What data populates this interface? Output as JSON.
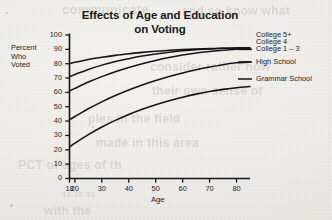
{
  "figure": {
    "title_line_1": "Effects of Age and Education",
    "title_line_2": "on Voting",
    "y_caption_line_1": "Percent",
    "y_caption_line_2": "Who",
    "y_caption_line_3": "Voted",
    "x_caption": "Age"
  },
  "ghost_text": {
    "line_1": "communicate",
    "line_2": "and so know what",
    "line_3": "consider rather how",
    "line_4": "their own sense of",
    "line_5": "ples in the field",
    "line_6": "made in this area",
    "line_7": "PCT of ages of th",
    "line_8": "18 20      30",
    "line_9": "with the"
  },
  "chart_data": {
    "type": "line",
    "title": "Effects of Age and Education on Voting",
    "xlabel": "Age",
    "ylabel": "Percent Who Voted",
    "xlim": [
      18,
      85
    ],
    "ylim": [
      0,
      100
    ],
    "grid": false,
    "legend_position": "right-of-plot-direct-labels",
    "x_ticks": [
      18,
      20,
      30,
      40,
      50,
      60,
      70,
      80
    ],
    "x_tick_labels": [
      "18",
      "20",
      "30",
      "40",
      "50",
      "60",
      "70",
      "80"
    ],
    "y_ticks": [
      0,
      10,
      20,
      30,
      40,
      50,
      60,
      70,
      80,
      90,
      100
    ],
    "y_tick_labels": [
      "0",
      "10",
      "20",
      "30",
      "40",
      "50",
      "60",
      "70",
      "80",
      "90",
      "100"
    ],
    "x": [
      18,
      20,
      25,
      30,
      35,
      40,
      45,
      50,
      55,
      60,
      65,
      70,
      75,
      80,
      85
    ],
    "series": [
      {
        "name": "College 5+",
        "label": "College 5+",
        "values": [
          80,
          81,
          83,
          84.5,
          85.8,
          86.9,
          87.9,
          88.7,
          89.3,
          89.8,
          90.2,
          90.5,
          90.8,
          91,
          91
        ]
      },
      {
        "name": "College 4",
        "label": "College 4",
        "values": [
          71,
          72.5,
          76,
          79,
          81.5,
          83.5,
          85.3,
          86.8,
          88,
          89,
          89.8,
          90.3,
          90.7,
          91,
          91
        ]
      },
      {
        "name": "College 1 – 3",
        "label": "College 1 – 3",
        "values": [
          61,
          62.8,
          67.2,
          71,
          74.4,
          77.4,
          80,
          82.3,
          84.3,
          86,
          87.4,
          88.5,
          89.4,
          90,
          90.3
        ]
      },
      {
        "name": "High School",
        "label": "High School",
        "values": [
          41,
          43.2,
          48.6,
          53.4,
          57.8,
          61.7,
          65.2,
          68.3,
          71.1,
          73.6,
          75.8,
          77.7,
          79.3,
          80.6,
          81.2
        ]
      },
      {
        "name": "Grammar School",
        "label": "Grammar School",
        "values": [
          22,
          24.6,
          30.6,
          35.9,
          40.5,
          44.6,
          48.2,
          51.4,
          54.2,
          56.7,
          58.8,
          60.6,
          62.1,
          63.3,
          64.1
        ]
      }
    ]
  }
}
